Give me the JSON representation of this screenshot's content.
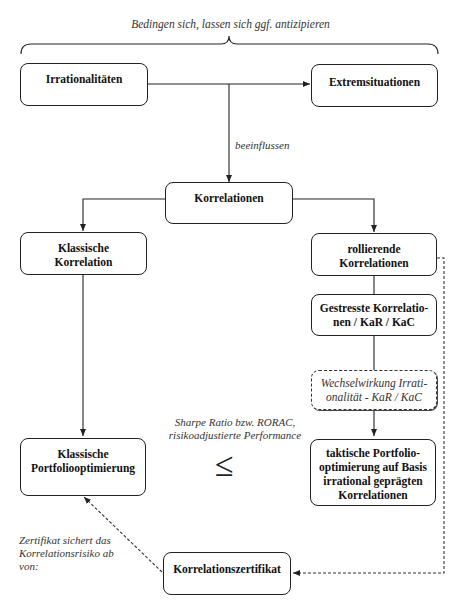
{
  "top_annotation": "Bedingen sich, lassen sich ggf. antizipieren",
  "nodes": {
    "irrationalitaeten": "Irrationalitäten",
    "extremsituationen": "Extremsituationen",
    "korrelationen": "Korrelationen",
    "klassische_korrelation_1": "Klassische",
    "klassische_korrelation_2": "Korrelation",
    "rollierende_1": "rollierende",
    "rollierende_2": "Korrelationen",
    "gestresste_1": "Gestresste Korrelatio-",
    "gestresste_2": "nen / KaR / KaC",
    "wechselwirkung_1": "Wechselwirkung Irrati-",
    "wechselwirkung_2": "onalität - KaR / KaC",
    "klassische_po_1": "Klassische",
    "klassische_po_2": "Portfoliooptimierung",
    "taktische_1": "taktische Portfolio-",
    "taktische_2": "optimierung auf Basis",
    "taktische_3": "irrational geprägten",
    "taktische_4": "Korrelationen",
    "zertifikat": "Korrelationszertifikat"
  },
  "labels": {
    "beeinflussen": "beeinflussen",
    "sharpe_1": "Sharpe Ratio bzw. RORAC,",
    "sharpe_2": "risikoadjustierte Performance",
    "comparison_symbol": "≤",
    "zertifikat_note_1": "Zertifikat sichert das",
    "zertifikat_note_2": "Korrelationsrisiko ab",
    "zertifikat_note_3": "von:"
  }
}
